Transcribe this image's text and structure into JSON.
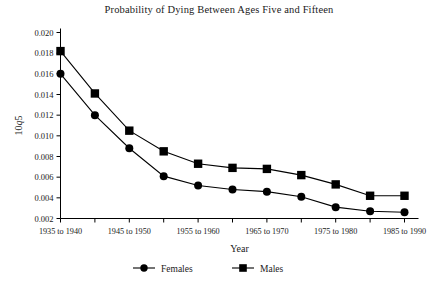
{
  "chart_data": {
    "type": "line",
    "title": "Probability of Dying Between Ages Five and Fifteen",
    "xlabel": "Year",
    "ylabel": "10q5",
    "ylabel_prefix": "10",
    "ylabel_italic": "q",
    "ylabel_suffix": "5",
    "categories": [
      "1935 to 1940",
      "1940 to 1945",
      "1945 to 1950",
      "1950 to 1955",
      "1955 to 1960",
      "1960 to 1965",
      "1965 to 1970",
      "1970 to 1975",
      "1975 to 1980",
      "1980 to 1985",
      "1985 to 1990"
    ],
    "xtick_labels_shown": [
      "1935 to 1940",
      "1945 to 1950",
      "1955 to 1960",
      "1965 to 1970",
      "1975 to 1980",
      "1985 to 1990"
    ],
    "ytick_labels": [
      "0.002",
      "0.004",
      "0.006",
      "0.008",
      "0.010",
      "0.012",
      "0.014",
      "0.016",
      "0.018",
      "0.020"
    ],
    "ytick_values": [
      0.002,
      0.004,
      0.006,
      0.008,
      0.01,
      0.012,
      0.014,
      0.016,
      0.018,
      0.02
    ],
    "ylim": [
      0.002,
      0.02
    ],
    "grid": false,
    "legend_position": "bottom-center",
    "series": [
      {
        "name": "Females",
        "marker": "circle",
        "color": "#000000",
        "values": [
          0.016,
          0.012,
          0.0088,
          0.0061,
          0.0052,
          0.0048,
          0.0046,
          0.0041,
          0.0031,
          0.0027,
          0.0026
        ]
      },
      {
        "name": "Males",
        "marker": "square",
        "color": "#000000",
        "values": [
          0.0182,
          0.0141,
          0.0105,
          0.0085,
          0.0073,
          0.0069,
          0.0068,
          0.0062,
          0.0053,
          0.0042,
          0.0042
        ]
      }
    ]
  },
  "legend": {
    "entries": [
      {
        "label": "Females",
        "marker": "circle"
      },
      {
        "label": "Males",
        "marker": "square"
      }
    ]
  }
}
